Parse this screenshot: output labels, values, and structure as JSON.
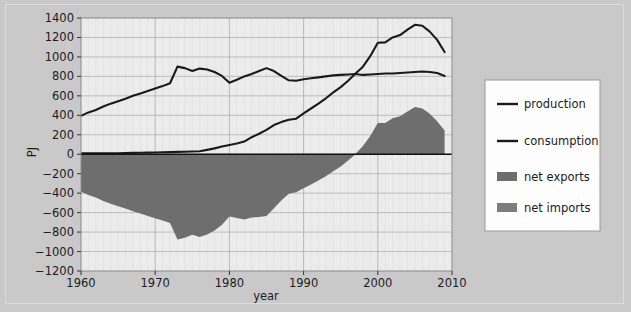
{
  "figure": {
    "background_color": "#c9c9c9",
    "plot_background_color": "#ececec",
    "frame_border_color": "#dcdcdc"
  },
  "chart_data": {
    "type": "area",
    "title": "",
    "subtitle": "",
    "xlabel": "year",
    "ylabel": "PJ",
    "xlim": [
      1960,
      2010
    ],
    "ylim": [
      -1200,
      1400
    ],
    "xticks": [
      1960,
      1970,
      1980,
      1990,
      2000,
      2010
    ],
    "xticklabels": [
      "1960",
      "1970",
      "1980",
      "1990",
      "2000",
      "2010"
    ],
    "yticks": [
      -1200,
      -1000,
      -800,
      -600,
      -400,
      -200,
      0,
      200,
      400,
      600,
      800,
      1000,
      1200,
      1400
    ],
    "yticklabels": [
      "−1200",
      "−1000",
      "−800",
      "−600",
      "−400",
      "−200",
      "0",
      "200",
      "400",
      "600",
      "800",
      "1000",
      "1200",
      "1400"
    ],
    "grid": true,
    "minor_grid": true,
    "legend_position": "right-outside",
    "x": [
      1960,
      1961,
      1962,
      1963,
      1964,
      1965,
      1966,
      1967,
      1968,
      1969,
      1970,
      1971,
      1972,
      1973,
      1974,
      1975,
      1976,
      1977,
      1978,
      1979,
      1980,
      1981,
      1982,
      1983,
      1984,
      1985,
      1986,
      1987,
      1988,
      1989,
      1990,
      1991,
      1992,
      1993,
      1994,
      1995,
      1996,
      1997,
      1998,
      1999,
      2000,
      2001,
      2002,
      2003,
      2004,
      2005,
      2006,
      2007,
      2008,
      2009
    ],
    "series": [
      {
        "name": "consumption",
        "type": "line",
        "color": "#1a1a1a",
        "values": [
          395,
          430,
          455,
          490,
          520,
          545,
          570,
          600,
          625,
          650,
          675,
          700,
          730,
          900,
          885,
          855,
          880,
          870,
          845,
          805,
          735,
          765,
          800,
          825,
          855,
          885,
          855,
          805,
          760,
          755,
          770,
          780,
          790,
          800,
          810,
          815,
          820,
          825,
          815,
          820,
          825,
          830,
          830,
          835,
          840,
          845,
          850,
          845,
          835,
          805
        ]
      },
      {
        "name": "production",
        "type": "line",
        "color": "#1a1a1a",
        "values": [
          10,
          10,
          10,
          10,
          10,
          10,
          12,
          14,
          15,
          16,
          18,
          20,
          22,
          24,
          26,
          28,
          30,
          45,
          60,
          80,
          95,
          110,
          130,
          175,
          210,
          250,
          300,
          330,
          355,
          365,
          420,
          470,
          520,
          575,
          635,
          690,
          755,
          830,
          900,
          1010,
          1145,
          1150,
          1200,
          1225,
          1280,
          1330,
          1320,
          1260,
          1175,
          1050
        ]
      },
      {
        "name": "net exports",
        "type": "area",
        "color": "#6e6e6e",
        "description": "positive values, production minus consumption above zero",
        "values": [
          0,
          0,
          0,
          0,
          0,
          0,
          0,
          0,
          0,
          0,
          0,
          0,
          0,
          0,
          0,
          0,
          0,
          0,
          0,
          0,
          0,
          0,
          0,
          0,
          0,
          0,
          0,
          0,
          0,
          0,
          0,
          0,
          0,
          0,
          0,
          0,
          0,
          5,
          85,
          190,
          320,
          320,
          370,
          390,
          440,
          485,
          470,
          415,
          340,
          245
        ]
      },
      {
        "name": "net imports",
        "type": "area",
        "color": "#6e6e6e",
        "description": "negative values, consumption minus production below zero",
        "values": [
          -385,
          -420,
          -445,
          -480,
          -510,
          -535,
          -558,
          -586,
          -610,
          -634,
          -657,
          -680,
          -708,
          -876,
          -859,
          -827,
          -850,
          -825,
          -785,
          -725,
          -640,
          -655,
          -670,
          -650,
          -645,
          -635,
          -555,
          -475,
          -405,
          -390,
          -350,
          -310,
          -270,
          -225,
          -175,
          -125,
          -65,
          0,
          0,
          0,
          0,
          0,
          0,
          0,
          0,
          0,
          0,
          0,
          0,
          0
        ]
      }
    ]
  },
  "legend": {
    "items": [
      {
        "label": "production",
        "marker": "line",
        "color": "#1a1a1a"
      },
      {
        "label": "consumption",
        "marker": "line",
        "color": "#1a1a1a"
      },
      {
        "label": "net exports",
        "marker": "swatch",
        "color": "#6e6e6e"
      },
      {
        "label": "net imports",
        "marker": "swatch",
        "color": "#7d7d7d"
      }
    ]
  }
}
